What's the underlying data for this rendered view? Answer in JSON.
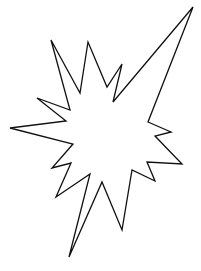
{
  "figure": {
    "background": "#ffffff",
    "stroke": "#111111",
    "stroke_width": 1.3,
    "fill": "#ffffff",
    "points": [
      [
        193,
        7
      ],
      [
        148,
        122
      ],
      [
        171,
        132
      ],
      [
        155,
        136
      ],
      [
        182,
        164
      ],
      [
        147,
        162
      ],
      [
        155,
        181
      ],
      [
        132,
        170
      ],
      [
        122,
        230
      ],
      [
        102,
        182
      ],
      [
        69,
        257
      ],
      [
        90,
        174
      ],
      [
        56,
        197
      ],
      [
        71,
        163
      ],
      [
        52,
        168
      ],
      [
        73,
        144
      ],
      [
        10,
        128
      ],
      [
        66,
        121
      ],
      [
        37,
        98
      ],
      [
        70,
        110
      ],
      [
        51,
        40
      ],
      [
        80,
        93
      ],
      [
        88,
        42
      ],
      [
        107,
        87
      ],
      [
        122,
        64
      ],
      [
        113,
        102
      ]
    ]
  }
}
